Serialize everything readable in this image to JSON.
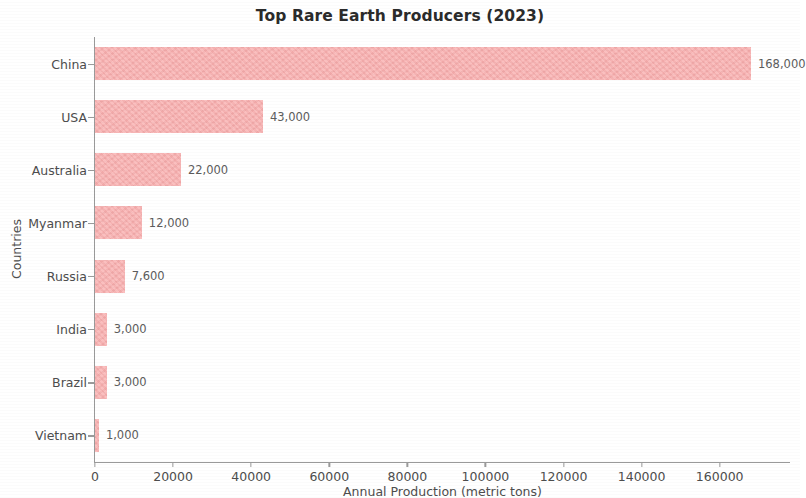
{
  "chart_data": {
    "type": "bar",
    "orientation": "horizontal",
    "title": "Top Rare Earth Producers (2023)",
    "xlabel": "Annual Production (metric tons)",
    "ylabel": "Countries",
    "categories": [
      "China",
      "USA",
      "Australia",
      "Myanmar",
      "Russia",
      "India",
      "Brazil",
      "Vietnam"
    ],
    "values": [
      168000,
      43000,
      22000,
      12000,
      7600,
      3000,
      3000,
      1000
    ],
    "value_labels": [
      "168,000",
      "43,000",
      "22,000",
      "12,000",
      "7,600",
      "3,000",
      "3,000",
      "1,000"
    ],
    "xlim": [
      0,
      178000
    ],
    "xticks": [
      0,
      20000,
      40000,
      60000,
      80000,
      100000,
      120000,
      140000,
      160000
    ],
    "xtick_labels": [
      "0",
      "20000",
      "40000",
      "60000",
      "80000",
      "100000",
      "120000",
      "140000",
      "160000"
    ],
    "grid": false,
    "legend": null,
    "bar_color": "#f9aeae",
    "text_color": "#4d4d4d",
    "title_color": "#2b2b2b",
    "axis_color": "#9a9a9a"
  }
}
